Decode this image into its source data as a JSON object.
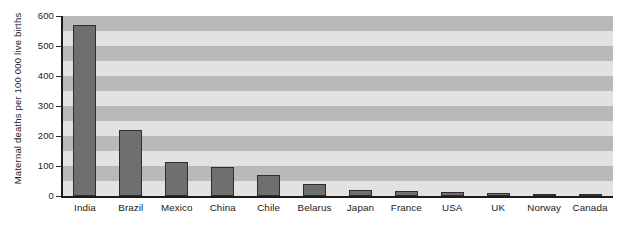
{
  "chart_data": {
    "type": "bar",
    "title": "",
    "subtitle": "",
    "xlabel": "",
    "ylabel": "Maternal deaths per 100 000 live births",
    "ylim": [
      0,
      600
    ],
    "yticks": [
      0,
      100,
      200,
      300,
      400,
      500,
      600
    ],
    "ytick_labels": [
      "0",
      "100",
      "200",
      "300",
      "400",
      "500",
      "600"
    ],
    "grid": false,
    "banded_background": true,
    "band_step": 50,
    "legend": null,
    "legend_position": "none",
    "annotations": [],
    "categories": [
      "India",
      "Brazil",
      "Mexico",
      "China",
      "Chile",
      "Belarus",
      "Japan",
      "France",
      "USA",
      "UK",
      "Norway",
      "Canada"
    ],
    "values": [
      570,
      220,
      113,
      98,
      70,
      40,
      20,
      18,
      12,
      10,
      6,
      5
    ],
    "series": [
      {
        "name": "Maternal deaths per 100 000 live births",
        "values": [
          570,
          220,
          113,
          98,
          70,
          40,
          20,
          18,
          12,
          10,
          6,
          5
        ]
      }
    ],
    "colors": {
      "bar_fill": "#6f6f6f",
      "bar_border": "#2e2e2e",
      "band_light": "#e2e2e2",
      "band_dark": "#b9b9b9",
      "axis": "#1c1c1c",
      "text": "#1a1a1a",
      "background": "#ffffff"
    }
  }
}
